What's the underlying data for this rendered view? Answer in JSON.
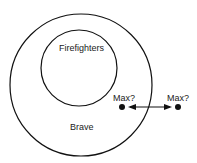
{
  "diagram": {
    "outer_set": {
      "label": "Brave"
    },
    "inner_set": {
      "label": "Firefighters"
    },
    "points": [
      {
        "label": "Max?"
      },
      {
        "label": "Max?"
      }
    ],
    "arrow": "double-headed",
    "stroke_color": "#111111"
  }
}
